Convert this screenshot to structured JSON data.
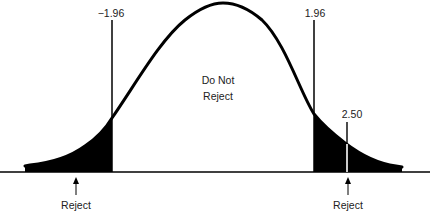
{
  "diagram": {
    "type": "two-tailed hypothesis test (normal distribution)",
    "critical_values": {
      "lower": "−1.96",
      "upper": "1.96"
    },
    "test_statistic": "2.50",
    "center_region_label": [
      "Do Not",
      "Reject"
    ],
    "tail_labels": {
      "left": "Reject",
      "right": "Reject"
    },
    "colors": {
      "curve": "#000000",
      "rejection_region_fill": "#000000",
      "background": "#ffffff"
    }
  }
}
